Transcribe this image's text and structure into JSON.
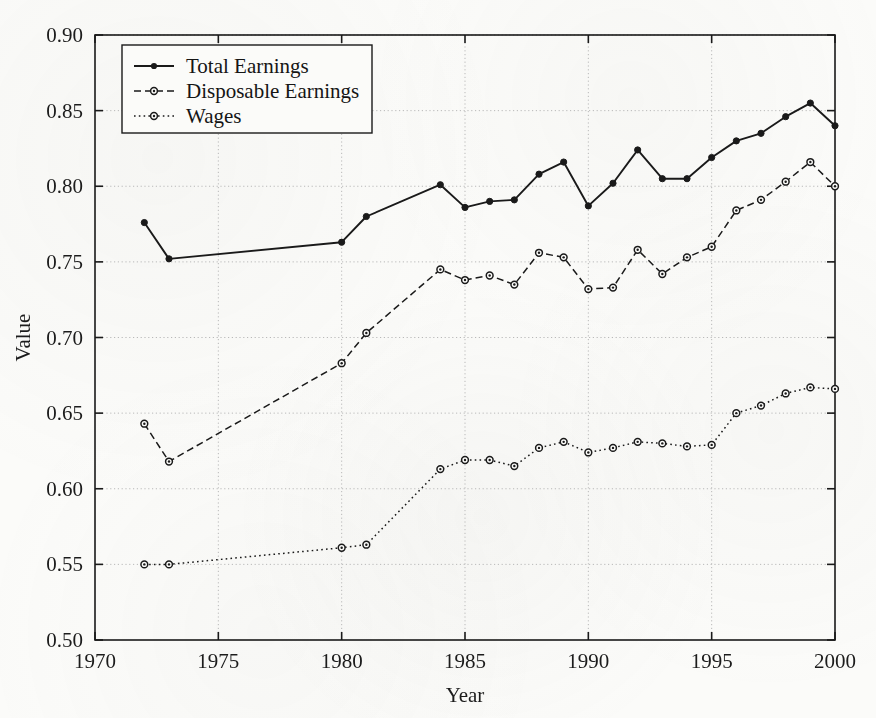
{
  "figure": {
    "background_color": "#fbfbf9",
    "ink_color": "#1a1a1a",
    "grid_color": "#b9b9b9"
  },
  "axes": {
    "x_title": "Year",
    "y_title": "Value",
    "x_ticks": [
      "1970",
      "1975",
      "1980",
      "1985",
      "1990",
      "1995",
      "2000"
    ],
    "y_ticks": [
      "0.50",
      "0.55",
      "0.60",
      "0.65",
      "0.70",
      "0.75",
      "0.80",
      "0.85",
      "0.90"
    ],
    "xlim": [
      1970,
      2000
    ],
    "ylim": [
      0.5,
      0.9
    ],
    "grid": true
  },
  "legend": {
    "position": "top-left-inside",
    "entries": [
      {
        "label": "Total Earnings",
        "style": "solid",
        "marker": "filled-dot"
      },
      {
        "label": "Disposable Earnings",
        "style": "dashed",
        "marker": "open-circle"
      },
      {
        "label": "Wages",
        "style": "dotted",
        "marker": "open-circle"
      }
    ]
  },
  "chart_data": {
    "type": "line",
    "title": "",
    "xlabel": "Year",
    "ylabel": "Value",
    "xlim": [
      1970,
      2000
    ],
    "ylim": [
      0.5,
      0.9
    ],
    "grid": true,
    "legend_position": "upper left",
    "series": [
      {
        "name": "Total Earnings",
        "style": "solid",
        "marker": "filled-dot",
        "color": "#1a1a1a",
        "x": [
          1972,
          1973,
          1980,
          1981,
          1984,
          1985,
          1986,
          1987,
          1988,
          1989,
          1990,
          1991,
          1992,
          1993,
          1994,
          1995,
          1996,
          1997,
          1998,
          1999,
          2000
        ],
        "values": [
          0.776,
          0.752,
          0.763,
          0.78,
          0.801,
          0.786,
          0.79,
          0.791,
          0.808,
          0.816,
          0.787,
          0.802,
          0.824,
          0.805,
          0.805,
          0.819,
          0.83,
          0.835,
          0.846,
          0.855,
          0.84
        ]
      },
      {
        "name": "Disposable Earnings",
        "style": "dashed",
        "marker": "open-circle",
        "color": "#1a1a1a",
        "x": [
          1972,
          1973,
          1980,
          1981,
          1984,
          1985,
          1986,
          1987,
          1988,
          1989,
          1990,
          1991,
          1992,
          1993,
          1994,
          1995,
          1996,
          1997,
          1998,
          1999,
          2000
        ],
        "values": [
          0.643,
          0.618,
          0.683,
          0.703,
          0.745,
          0.738,
          0.741,
          0.735,
          0.756,
          0.753,
          0.732,
          0.733,
          0.758,
          0.742,
          0.753,
          0.76,
          0.784,
          0.791,
          0.803,
          0.816,
          0.8
        ]
      },
      {
        "name": "Wages",
        "style": "dotted",
        "marker": "open-circle",
        "color": "#1a1a1a",
        "x": [
          1972,
          1973,
          1980,
          1981,
          1984,
          1985,
          1986,
          1987,
          1988,
          1989,
          1990,
          1991,
          1992,
          1993,
          1994,
          1995,
          1996,
          1997,
          1998,
          1999,
          2000
        ],
        "values": [
          0.55,
          0.55,
          0.561,
          0.563,
          0.613,
          0.619,
          0.619,
          0.615,
          0.627,
          0.631,
          0.624,
          0.627,
          0.631,
          0.63,
          0.628,
          0.629,
          0.65,
          0.655,
          0.663,
          0.667,
          0.666
        ]
      }
    ]
  }
}
